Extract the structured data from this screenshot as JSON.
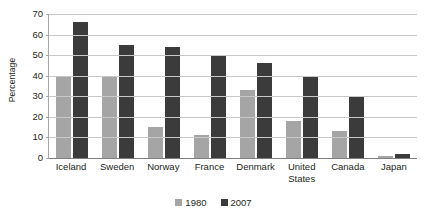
{
  "chart_data": {
    "type": "bar",
    "title": "",
    "subtitle": "",
    "xlabel": "",
    "ylabel": "Percentage",
    "ylim": [
      0,
      70
    ],
    "yticks": [
      0,
      10,
      20,
      30,
      40,
      50,
      60,
      70
    ],
    "ytick_labels": [
      "0",
      "10",
      "20",
      "30",
      "40",
      "50",
      "60",
      "70"
    ],
    "grid": true,
    "legend_position": "bottom",
    "categories": [
      "Iceland",
      "Sweden",
      "Norway",
      "France",
      "Denmark",
      "United States",
      "Canada",
      "Japan"
    ],
    "series": [
      {
        "name": "1980",
        "color": "#a5a5a5",
        "values": [
          40,
          40,
          15,
          11,
          33,
          18,
          13,
          1
        ]
      },
      {
        "name": "2007",
        "color": "#3b3b3b",
        "values": [
          66,
          55,
          54,
          50,
          46,
          40,
          30,
          2
        ]
      }
    ]
  },
  "axis": {
    "y_title": "Percentage"
  },
  "legend": {
    "items": [
      {
        "label": "1980",
        "color": "#a5a5a5"
      },
      {
        "label": "2007",
        "color": "#3b3b3b"
      }
    ]
  }
}
